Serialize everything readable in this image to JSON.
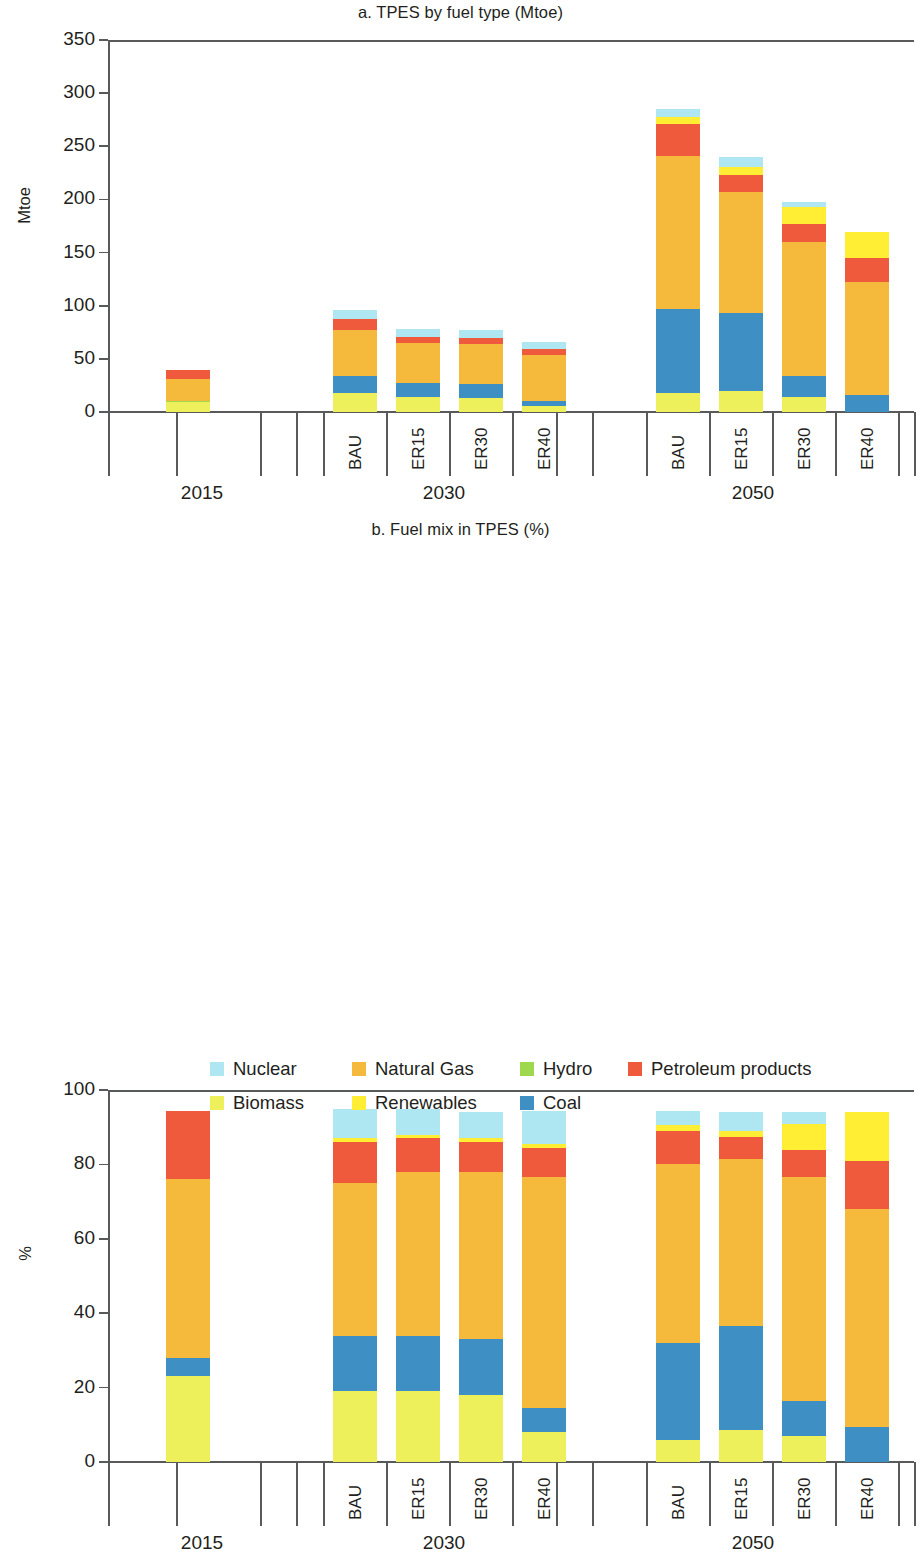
{
  "figure": {
    "panels": [
      {
        "id": "a",
        "title": "a. TPES by fuel type (Mtoe)",
        "ylabel": "Mtoe"
      },
      {
        "id": "b",
        "title": "b. Fuel mix in TPES (%)",
        "ylabel": "%"
      }
    ]
  },
  "legend": {
    "items": [
      {
        "label": "Nuclear",
        "color": "#AEE6F2"
      },
      {
        "label": "Natural Gas",
        "color": "#F5B93C"
      },
      {
        "label": "Hydro",
        "color": "#9ED84F"
      },
      {
        "label": "Petroleum products",
        "color": "#F05A3C"
      },
      {
        "label": "Biomass",
        "color": "#EDF05A"
      },
      {
        "label": "Renewables",
        "color": "#FFEE33"
      },
      {
        "label": "Coal",
        "color": "#3E8FC4"
      }
    ]
  },
  "axis": {
    "groups": [
      {
        "year": "2015",
        "scenarios": [
          "2015"
        ]
      },
      {
        "year": "2030",
        "scenarios": [
          "BAU",
          "ER15",
          "ER30",
          "ER40"
        ]
      },
      {
        "year": "2050",
        "scenarios": [
          "BAU",
          "ER15",
          "ER30",
          "ER40"
        ]
      }
    ]
  },
  "chart_data": [
    {
      "type": "bar",
      "stacked": true,
      "title": "a. TPES by fuel type (Mtoe)",
      "xlabel": "",
      "ylabel": "Mtoe",
      "ylim": [
        0,
        350
      ],
      "yticks": [
        0,
        50,
        100,
        150,
        200,
        250,
        300,
        350
      ],
      "grid": false,
      "legend_position": "bottom",
      "categories": [
        "2015",
        "2030 BAU",
        "2030 ER15",
        "2030 ER30",
        "2030 ER40",
        "2050 BAU",
        "2050 ER15",
        "2050 ER30",
        "2050 ER40"
      ],
      "series": [
        {
          "name": "Biomass",
          "color": "#EDF05A",
          "values": [
            9,
            18,
            14,
            13,
            6,
            18,
            20,
            14,
            0
          ]
        },
        {
          "name": "Hydro",
          "color": "#9ED84F",
          "values": [
            1.5,
            0,
            0,
            0,
            0,
            0,
            0,
            0,
            0
          ]
        },
        {
          "name": "Coal",
          "color": "#3E8FC4",
          "values": [
            0,
            16,
            13,
            13,
            4,
            79,
            73,
            20,
            16
          ]
        },
        {
          "name": "Natural Gas",
          "color": "#F5B93C",
          "values": [
            21,
            43,
            38,
            38,
            44,
            144,
            114,
            126,
            106
          ]
        },
        {
          "name": "Petroleum products",
          "color": "#F05A3C",
          "values": [
            8,
            11,
            6,
            6,
            5,
            30,
            16,
            17,
            23
          ]
        },
        {
          "name": "Renewables",
          "color": "#FFEE33",
          "values": [
            0,
            0,
            0,
            0,
            0,
            7,
            8,
            16,
            24
          ]
        },
        {
          "name": "Nuclear",
          "color": "#AEE6F2",
          "values": [
            0,
            8,
            7,
            7,
            7,
            7,
            9,
            5,
            0
          ]
        }
      ],
      "totals": [
        39.5,
        96,
        78,
        77,
        66,
        285,
        240,
        198,
        169
      ]
    },
    {
      "type": "bar",
      "stacked": true,
      "title": "b. Fuel mix in TPES (%)",
      "xlabel": "",
      "ylabel": "%",
      "ylim": [
        0,
        100
      ],
      "yticks": [
        0,
        20,
        40,
        60,
        80,
        100
      ],
      "grid": false,
      "legend_position": "bottom",
      "categories": [
        "2015",
        "2030 BAU",
        "2030 ER15",
        "2030 ER30",
        "2030 ER40",
        "2050 BAU",
        "2050 ER15",
        "2050 ER30",
        "2050 ER40"
      ],
      "series": [
        {
          "name": "Biomass",
          "color": "#EDF05A",
          "values": [
            23,
            19,
            19,
            18,
            8,
            6,
            8.5,
            7,
            0
          ]
        },
        {
          "name": "Coal",
          "color": "#3E8FC4",
          "values": [
            5,
            15,
            15,
            15,
            6.5,
            26,
            28,
            9.5,
            9.5
          ]
        },
        {
          "name": "Natural Gas",
          "color": "#F5B93C",
          "values": [
            48,
            41,
            44,
            45,
            62,
            48,
            45,
            60,
            58.5
          ]
        },
        {
          "name": "Petroleum products",
          "color": "#F05A3C",
          "values": [
            18.5,
            11,
            9,
            8,
            8,
            9,
            6,
            7.5,
            13
          ]
        },
        {
          "name": "Renewables",
          "color": "#FFEE33",
          "values": [
            0,
            1,
            1,
            1,
            1,
            1.5,
            1.5,
            7,
            13
          ]
        },
        {
          "name": "Nuclear",
          "color": "#AEE6F2",
          "values": [
            0,
            8,
            7,
            7,
            9,
            4,
            5,
            3,
            0
          ]
        }
      ],
      "totals": [
        94.5,
        95,
        95,
        94,
        94.5,
        94.5,
        94,
        94,
        94
      ]
    }
  ]
}
